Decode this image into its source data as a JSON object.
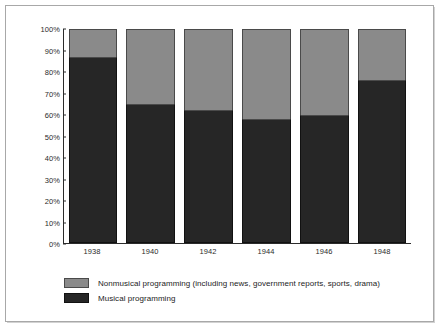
{
  "chart_data": {
    "type": "bar",
    "subtype": "100% stacked bar",
    "title": "",
    "xlabel": "",
    "ylabel": "",
    "ylim": [
      0,
      100
    ],
    "y_unit": "%",
    "grid": false,
    "legend_position": "bottom-left",
    "categories": [
      "1938",
      "1940",
      "1942",
      "1944",
      "1946",
      "1948"
    ],
    "y_ticks": [
      "0%",
      "10%",
      "20%",
      "30%",
      "40%",
      "50%",
      "60%",
      "70%",
      "80%",
      "90%",
      "100%"
    ],
    "y_tick_values": [
      0,
      10,
      20,
      30,
      40,
      50,
      60,
      70,
      80,
      90,
      100
    ],
    "series": [
      {
        "name": "Musical programming",
        "color": "#262626",
        "values": [
          87,
          65,
          62,
          58,
          60,
          76
        ]
      },
      {
        "name": "Nonmusical programming (including news, government reports, sports, drama)",
        "color": "#8a8a8a",
        "values": [
          13,
          35,
          38,
          42,
          40,
          24
        ]
      }
    ],
    "legend": [
      "Nonmusical programming (including news, government reports, sports, drama)",
      "Musical programming"
    ]
  },
  "colors": {
    "musical": "#262626",
    "nonmusical": "#8a8a8a",
    "axis": "#2b2b2b",
    "frame": "#a8a8a8",
    "background": "#ffffff"
  }
}
